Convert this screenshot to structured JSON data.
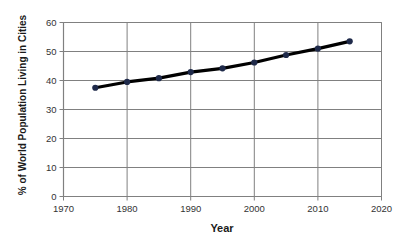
{
  "chart_data": {
    "type": "line",
    "title": "",
    "xlabel": "Year",
    "ylabel": "% of World Population Living in Cities",
    "x": [
      1975,
      1980,
      1985,
      1990,
      1995,
      2000,
      2005,
      2010,
      2015
    ],
    "values": [
      37.5,
      39.5,
      40.8,
      42.9,
      44.2,
      46.2,
      48.8,
      51.0,
      53.5
    ],
    "series": [
      {
        "name": "% of World Population Living in Cities",
        "values": [
          37.5,
          39.5,
          40.8,
          42.9,
          44.2,
          46.2,
          48.8,
          51.0,
          53.5
        ]
      }
    ],
    "xlim": [
      1970,
      2020
    ],
    "ylim": [
      0,
      60
    ],
    "xticks": [
      1970,
      1980,
      1990,
      2000,
      2010,
      2020
    ],
    "xtick_labels": [
      "1970",
      "1980",
      "1990",
      "2000",
      "2010",
      "2020"
    ],
    "yticks": [
      0,
      10,
      20,
      30,
      40,
      50,
      60
    ],
    "ytick_labels": [
      "0",
      "10",
      "20",
      "30",
      "40",
      "50",
      "60"
    ],
    "grid": "horizontal-and-vertical",
    "legend": "none",
    "line_color": "#000000",
    "marker_color": "#1f2a4a",
    "grid_color": "#808080",
    "axis_color": "#808080",
    "background": "#ffffff"
  },
  "axes": {
    "x_title": "Year",
    "y_title": "% of World Population Living in Cities"
  }
}
